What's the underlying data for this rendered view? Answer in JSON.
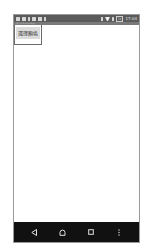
{
  "status_bar": {
    "left_icons": [
      "message-icon",
      "image-icon",
      "usb-icon",
      "download-icon",
      "phone-icon",
      "sd-card-icon"
    ],
    "right_icons": [
      "vibrate-icon",
      "wifi-icon",
      "signal-icon"
    ],
    "battery": "74",
    "time": "17:04"
  },
  "app_bar": {
    "title": "MyFirstAndroidApp"
  },
  "popup": {
    "button_label": "選擇顏色"
  },
  "nav_bar": {
    "buttons": [
      "back",
      "home",
      "recents",
      "menu"
    ]
  },
  "colors": {
    "status_bar": "#5b5b5b",
    "app_bar": "#7a7a7a",
    "nav_bar": "#111111",
    "button_bg": "#dcdcdc",
    "background": "#ffffff"
  }
}
